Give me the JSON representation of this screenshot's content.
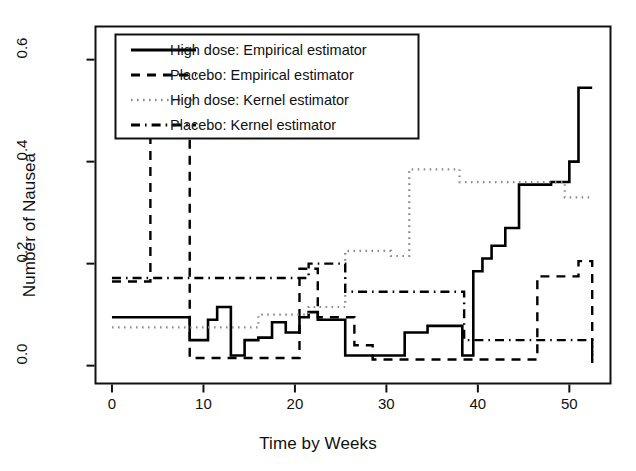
{
  "figure": {
    "kind": "step-function-plot",
    "background": "#ffffff",
    "ink_color": "#000000",
    "kernel_color": "#8c8c8c"
  },
  "axes": {
    "xlabel": "Time by Weeks",
    "ylabel": "Number of Nausea",
    "x_ticks": [
      "0",
      "10",
      "20",
      "30",
      "40",
      "50"
    ],
    "y_ticks": [
      "0.0",
      "0.2",
      "0.4",
      "0.6"
    ]
  },
  "legend": {
    "items": [
      {
        "label": "High dose: Empirical estimator",
        "style": "solid",
        "color": "#000000"
      },
      {
        "label": "Placebo: Empirical estimator",
        "style": "dashed",
        "color": "#000000"
      },
      {
        "label": "High dose: Kernel estimator",
        "style": "dotted",
        "color": "#8c8c8c"
      },
      {
        "label": "Placebo: Kernel estimator",
        "style": "dashdot",
        "color": "#000000"
      }
    ]
  },
  "chart_data": {
    "type": "line",
    "title": "",
    "xlabel": "Time by Weeks",
    "ylabel": "Number of Nausea",
    "xlim": [
      -1.8,
      54.5
    ],
    "ylim": [
      -0.035,
      0.665
    ],
    "x_ticks": [
      0,
      10,
      20,
      30,
      40,
      50
    ],
    "y_ticks": [
      0.0,
      0.2,
      0.4,
      0.6
    ],
    "grid": false,
    "legend_position": "top-left",
    "series": [
      {
        "name": "High dose: Empirical estimator",
        "style": "solid",
        "color": "#000000",
        "drawstyle": "steps-post",
        "x": [
          0,
          6.5,
          8.5,
          10.5,
          11.5,
          13,
          14.5,
          16,
          17.5,
          19,
          20.5,
          21.5,
          22.5,
          24.5,
          25.5,
          27,
          28.5,
          32,
          34.5,
          37.5,
          38.3,
          39.5,
          40.5,
          41.5,
          43,
          44.5,
          48,
          50,
          51,
          52.5
        ],
        "y": [
          0.095,
          0.095,
          0.05,
          0.09,
          0.115,
          0.02,
          0.05,
          0.055,
          0.085,
          0.065,
          0.095,
          0.105,
          0.09,
          0.09,
          0.02,
          0.02,
          0.02,
          0.065,
          0.078,
          0.078,
          0.02,
          0.185,
          0.21,
          0.235,
          0.27,
          0.355,
          0.36,
          0.4,
          0.545,
          0.545
        ]
      },
      {
        "name": "Placebo: Empirical estimator",
        "style": "dashed",
        "color": "#000000",
        "drawstyle": "steps-post",
        "x": [
          0,
          3.5,
          4.2,
          7.8,
          8.5,
          12.5,
          14,
          20.5,
          21.5,
          22.5,
          24.5,
          26.5,
          27.5,
          28.5,
          45.5,
          46.5,
          50,
          51,
          52.5
        ],
        "y": [
          0.165,
          0.165,
          0.51,
          0.51,
          0.015,
          0.015,
          0.015,
          0.19,
          0.19,
          0.095,
          0.095,
          0.04,
          0.04,
          0.012,
          0.012,
          0.175,
          0.175,
          0.205,
          0.005
        ]
      },
      {
        "name": "High dose: Kernel estimator",
        "style": "dotted",
        "color": "#8c8c8c",
        "drawstyle": "steps-post",
        "x": [
          0,
          7.5,
          8.5,
          13,
          16,
          20.5,
          21.5,
          24.5,
          25.5,
          27.5,
          30.5,
          31.5,
          32.5,
          38,
          44,
          48,
          49.5,
          52.5
        ],
        "y": [
          0.075,
          0.075,
          0.075,
          0.075,
          0.1,
          0.1,
          0.115,
          0.115,
          0.225,
          0.225,
          0.215,
          0.215,
          0.385,
          0.36,
          0.36,
          0.36,
          0.33,
          0.33
        ]
      },
      {
        "name": "Placebo: Kernel estimator",
        "style": "dashdot",
        "color": "#000000",
        "drawstyle": "steps-post",
        "x": [
          0,
          12,
          13,
          20.5,
          21.5,
          24.5,
          25.5,
          27.5,
          28.5,
          37.5,
          38.5,
          50,
          51,
          52.5
        ],
        "y": [
          0.172,
          0.172,
          0.172,
          0.172,
          0.2,
          0.2,
          0.145,
          0.145,
          0.145,
          0.145,
          0.05,
          0.05,
          0.05,
          0.02
        ]
      }
    ]
  }
}
